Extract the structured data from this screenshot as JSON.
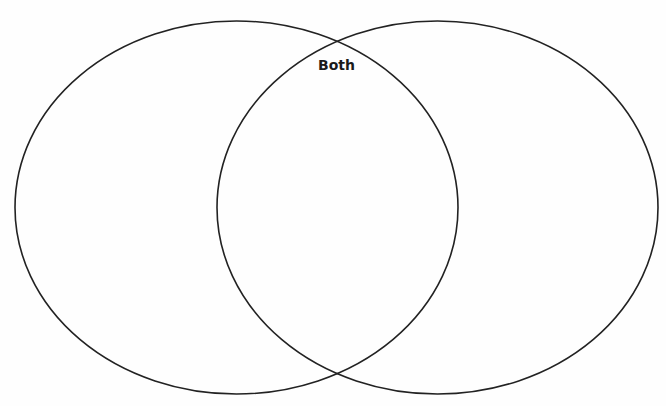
{
  "diagram": {
    "type": "venn",
    "sets": [
      {
        "id": "left",
        "label": "",
        "cx": 236.5,
        "cy": 207.5,
        "rx": 221.5,
        "ry": 186.5
      },
      {
        "id": "right",
        "label": "",
        "cx": 437.5,
        "cy": 207.5,
        "rx": 220.5,
        "ry": 186.5
      }
    ],
    "intersection_label": "Both",
    "stroke_color": "#222222",
    "background_color": "#fefefe"
  }
}
